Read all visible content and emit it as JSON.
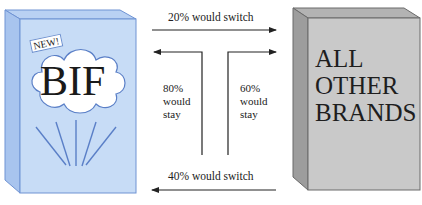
{
  "diagram": {
    "type": "brand-switching",
    "left_box": {
      "tag": "NEW!",
      "brand": "BIF",
      "colors": {
        "front": "#c7dcf6",
        "side": "#a8c4ee",
        "top": "#b9d1f3",
        "edge": "#6f93d3",
        "cloud": "#ffffff",
        "rays": "#5a7fc7"
      }
    },
    "right_box": {
      "lines": [
        "ALL",
        "OTHER",
        "BRANDS"
      ],
      "colors": {
        "front": "#c9c9c9",
        "side": "#9d9d9d",
        "top": "#b3b3b3",
        "edge": "#6a6a6a"
      }
    },
    "flows": {
      "top": {
        "label": "20% would switch",
        "direction": "right"
      },
      "bottom": {
        "label": "40% would switch",
        "direction": "left"
      },
      "left_stay": {
        "lines": [
          "80%",
          "would",
          "stay"
        ],
        "direction": "left"
      },
      "right_stay": {
        "lines": [
          "60%",
          "would",
          "stay"
        ],
        "direction": "right"
      }
    }
  }
}
